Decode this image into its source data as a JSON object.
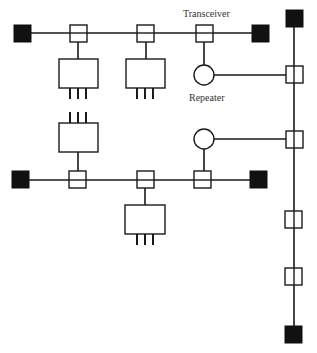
{
  "diagram": {
    "labels": {
      "transceiver": "Transceiver",
      "repeater": "Repeater"
    },
    "colors": {
      "line": "#1a1a1a",
      "terminator": "#111111",
      "background": "#ffffff"
    },
    "segments": [
      {
        "name": "top-horizontal-segment",
        "transceivers": 3,
        "stations": 2,
        "terminators": 2
      },
      {
        "name": "bottom-horizontal-segment",
        "transceivers": 3,
        "stations": 2,
        "terminators": 2
      },
      {
        "name": "vertical-backbone-segment",
        "transceivers": 4,
        "stations": 0,
        "terminators": 2
      }
    ],
    "repeaters": 2
  }
}
